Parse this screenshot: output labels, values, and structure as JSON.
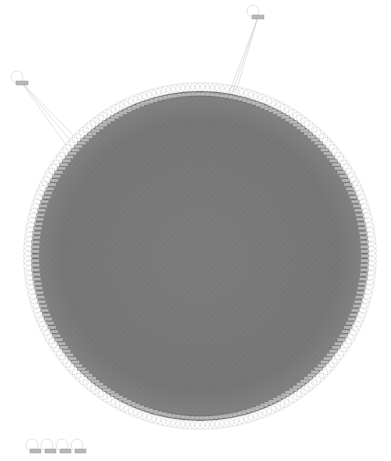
{
  "graph": {
    "layout": "circular",
    "background": "#ffffff",
    "ring": {
      "cx": 200,
      "cy": 256,
      "rx": 168,
      "ry": 165,
      "fill": "#7a7a7a",
      "node_fill": "#b8b8b8",
      "node_stroke": "#8a8a8a",
      "loop_stroke": "#c8c8c8",
      "node_count_estimate": 220
    },
    "outlier_nodes": [
      {
        "id": "outlier-left",
        "x": 22,
        "y": 83,
        "label": ""
      },
      {
        "id": "outlier-top-right",
        "x": 258,
        "y": 17,
        "label": ""
      }
    ],
    "isolated_nodes": [
      {
        "id": "isolated-1",
        "x": 35,
        "y": 451,
        "label": ""
      },
      {
        "id": "isolated-2",
        "x": 50,
        "y": 451,
        "label": ""
      },
      {
        "id": "isolated-3",
        "x": 65,
        "y": 451,
        "label": ""
      },
      {
        "id": "isolated-4",
        "x": 80,
        "y": 451,
        "label": ""
      }
    ],
    "edge_color": "#d0d0d0",
    "dense_edge_color": "#6e6e6e"
  }
}
